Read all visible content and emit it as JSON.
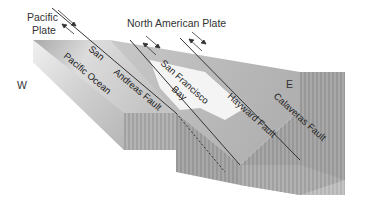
{
  "diagram": {
    "labels": {
      "pacific_plate_line1": "Pacific",
      "pacific_plate_line2": "Plate",
      "north_american_plate": "North American Plate",
      "west": "W",
      "east": "E",
      "san": "San",
      "pacific_ocean": "Pacific Ocean",
      "andreas_fault": "Andreas Fault",
      "san_francisco": "San Francisco",
      "bay": "Bay",
      "hayward_fault": "Hayward Fault",
      "calaveras_fault": "Calaveras Fault"
    },
    "arrows": [
      {
        "name": "san-andreas-motion",
        "description": "opposing arrows indicating right-lateral strike-slip motion"
      },
      {
        "name": "hayward-motion",
        "description": "opposing arrows indicating right-lateral strike-slip motion"
      },
      {
        "name": "calaveras-motion",
        "description": "opposing arrows indicating right-lateral strike-slip motion"
      }
    ],
    "colors": {
      "block_top_light": "#e6e6e6",
      "block_top_dark": "#a8a8a8",
      "block_side": "#9a9a9a",
      "fault_line": "#333333",
      "bay_water": "#f4f4f4"
    }
  }
}
